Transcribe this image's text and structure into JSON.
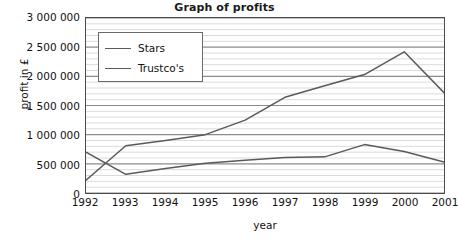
{
  "chart_data": {
    "type": "line",
    "title": "Graph of profits",
    "xlabel": "year",
    "ylabel": "profit in £",
    "categories": [
      "1992",
      "1993",
      "1994",
      "1995",
      "1996",
      "1997",
      "1998",
      "1999",
      "2000",
      "2001"
    ],
    "x": [
      1992,
      1993,
      1994,
      1995,
      1996,
      1997,
      1998,
      1999,
      2000,
      2001
    ],
    "ylim": [
      0,
      3000000
    ],
    "xlim": [
      1992,
      2001
    ],
    "ytick_labels": [
      "0",
      "500 000",
      "1 000 000",
      "1 500 000",
      "2 000 000",
      "2 500 000",
      "3 000 000"
    ],
    "ytick_values": [
      0,
      500000,
      1000000,
      1500000,
      2000000,
      2500000,
      3000000
    ],
    "ymajor_step": 500000,
    "yminor_step": 100000,
    "grid": true,
    "grid_major_color": "#8c8c8c",
    "grid_minor_color": "#d2d2d2",
    "legend_position": "upper left",
    "series": [
      {
        "name": "Stars",
        "color": "#5a5a5a",
        "values": [
          220000,
          810000,
          900000,
          1000000,
          1250000,
          1640000,
          1840000,
          2030000,
          2420000,
          1720000
        ]
      },
      {
        "name": "Trustco's",
        "color": "#5a5a5a",
        "values": [
          700000,
          320000,
          420000,
          510000,
          560000,
          610000,
          620000,
          830000,
          710000,
          530000
        ]
      }
    ]
  },
  "legend": {
    "entries": [
      {
        "label": "Stars"
      },
      {
        "label": "Trustco's"
      }
    ]
  }
}
